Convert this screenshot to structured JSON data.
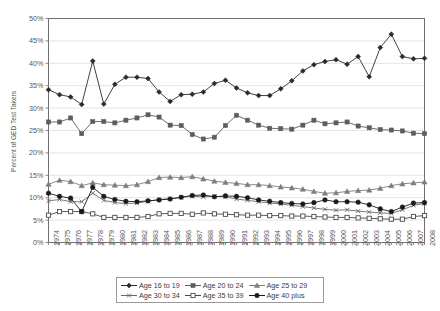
{
  "chart_data": {
    "type": "line",
    "title": "",
    "xlabel": "",
    "ylabel": "Percent of GED Test Takers",
    "ylim": [
      0,
      50
    ],
    "ytick_labels": [
      "0%",
      "5%",
      "10%",
      "15%",
      "20%",
      "25%",
      "30%",
      "35%",
      "40%",
      "45%",
      "50%"
    ],
    "ytick_values": [
      0,
      5,
      10,
      15,
      20,
      25,
      30,
      35,
      40,
      45,
      50
    ],
    "grid": true,
    "legend_position": "bottom",
    "categories": [
      "1974",
      "1975",
      "1976",
      "1977",
      "1978",
      "1979",
      "1980",
      "1981",
      "1982",
      "1983",
      "1984",
      "1985",
      "1986",
      "1987",
      "1988",
      "1989",
      "1990",
      "1991",
      "1992",
      "1993",
      "1994",
      "1995",
      "1996",
      "1997",
      "1998",
      "1999",
      "2000",
      "2001",
      "2002",
      "2003",
      "2004",
      "2005",
      "2006",
      "2007",
      "2008"
    ],
    "series": [
      {
        "name": "Age 16 to 19",
        "marker": "diamond",
        "color": "#2b2b2b",
        "values": [
          34.1,
          33.0,
          32.5,
          30.8,
          40.5,
          30.9,
          35.3,
          36.9,
          36.9,
          36.6,
          33.6,
          31.5,
          33.0,
          33.1,
          33.6,
          35.5,
          36.2,
          34.5,
          33.4,
          32.8,
          32.8,
          34.3,
          36.1,
          38.3,
          39.7,
          40.4,
          40.8,
          39.8,
          41.5,
          37.0,
          43.5,
          46.5,
          41.5,
          41.0,
          41.1
        ]
      },
      {
        "name": "Age 20 to 24",
        "marker": "square-filled",
        "color": "#5d5d5d",
        "values": [
          26.9,
          26.9,
          27.8,
          24.3,
          27.0,
          27.0,
          26.7,
          27.3,
          27.8,
          28.5,
          28.0,
          26.2,
          26.1,
          24.1,
          23.1,
          23.5,
          26.1,
          28.4,
          27.3,
          26.2,
          25.5,
          25.4,
          25.3,
          26.2,
          27.3,
          26.5,
          26.7,
          26.9,
          26.0,
          25.6,
          25.2,
          25.1,
          24.9,
          24.4,
          24.3
        ]
      },
      {
        "name": "Age 25 to 29",
        "marker": "triangle",
        "color": "#7d7d7d",
        "values": [
          13.0,
          13.9,
          13.6,
          12.7,
          13.3,
          12.9,
          12.8,
          12.7,
          12.9,
          13.6,
          14.5,
          14.6,
          14.5,
          14.7,
          14.2,
          13.7,
          13.4,
          13.2,
          12.9,
          12.9,
          12.7,
          12.4,
          12.2,
          11.9,
          11.4,
          11.0,
          11.1,
          11.4,
          11.6,
          11.7,
          12.1,
          12.7,
          13.1,
          13.3,
          13.5
        ]
      },
      {
        "name": "Age 30 to 34",
        "marker": "x",
        "color": "#6a6a6a",
        "values": [
          9.3,
          9.6,
          9.1,
          9.1,
          11.0,
          9.4,
          8.9,
          8.7,
          8.8,
          9.2,
          9.6,
          9.8,
          10.1,
          10.3,
          10.2,
          10.3,
          10.2,
          9.7,
          9.4,
          9.1,
          8.8,
          8.6,
          8.3,
          8.0,
          7.7,
          7.4,
          7.2,
          7.3,
          7.0,
          6.8,
          6.6,
          6.5,
          7.3,
          8.3,
          8.7
        ]
      },
      {
        "name": "Age 35 to 39",
        "marker": "square-open",
        "color": "#4a4a4a",
        "values": [
          6.1,
          6.9,
          6.9,
          6.9,
          6.4,
          5.6,
          5.6,
          5.6,
          5.6,
          5.8,
          6.4,
          6.5,
          6.5,
          6.3,
          6.6,
          6.4,
          6.3,
          6.2,
          6.1,
          6.1,
          6.0,
          6.0,
          5.9,
          5.9,
          5.8,
          5.7,
          5.6,
          5.6,
          5.5,
          5.4,
          5.3,
          5.2,
          5.2,
          5.8,
          6.0
        ]
      },
      {
        "name": "Age 40 plus",
        "marker": "circle-filled",
        "color": "#1a1a1a",
        "values": [
          11.0,
          10.3,
          9.9,
          6.9,
          12.3,
          10.3,
          9.6,
          9.2,
          9.1,
          9.3,
          9.5,
          9.7,
          10.1,
          10.5,
          10.6,
          10.2,
          10.4,
          10.3,
          10.0,
          9.5,
          9.2,
          8.9,
          8.7,
          8.6,
          8.9,
          9.5,
          9.1,
          9.1,
          9.0,
          8.4,
          7.5,
          6.9,
          7.9,
          8.8,
          8.9
        ]
      }
    ]
  }
}
